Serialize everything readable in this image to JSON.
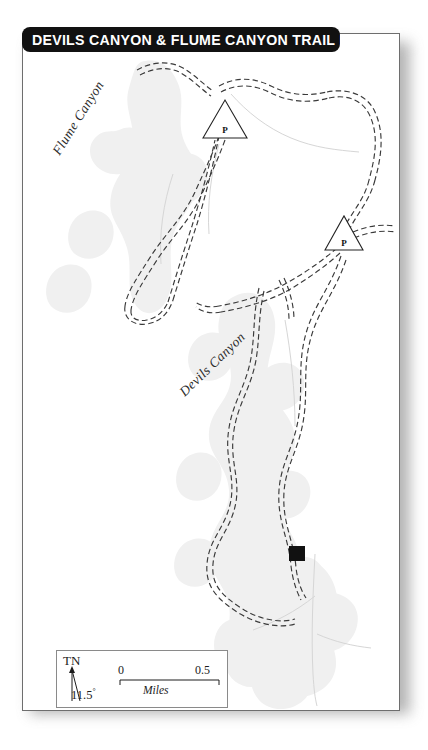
{
  "map": {
    "title": "DEVILS CANYON & FLUME CANYON TRAIL MAP",
    "sheet_background": "#ffffff",
    "banner_color": "#111111",
    "banner_text_color": "#ffffff",
    "terrain_fill": "#f0f0f0",
    "trail_color": "#3a3a3a",
    "stream_color": "#d8d8d8"
  },
  "labels": {
    "flume_canyon": "Flume Canyon",
    "devils_canyon": "Devils Canyon"
  },
  "markers": [
    {
      "name": "parking-north",
      "symbol": "P",
      "shape": "triangle",
      "x": 202,
      "y": 92
    },
    {
      "name": "parking-east",
      "symbol": "P",
      "shape": "triangle",
      "x": 321,
      "y": 205
    },
    {
      "name": "trail-terminus",
      "symbol": "",
      "shape": "square",
      "x": 295,
      "y": 555
    }
  ],
  "scale": {
    "north_label": "TN",
    "declination": "11.5",
    "declination_degree_symbol": "°",
    "min": "0",
    "max": "0.5",
    "units": "Miles"
  }
}
